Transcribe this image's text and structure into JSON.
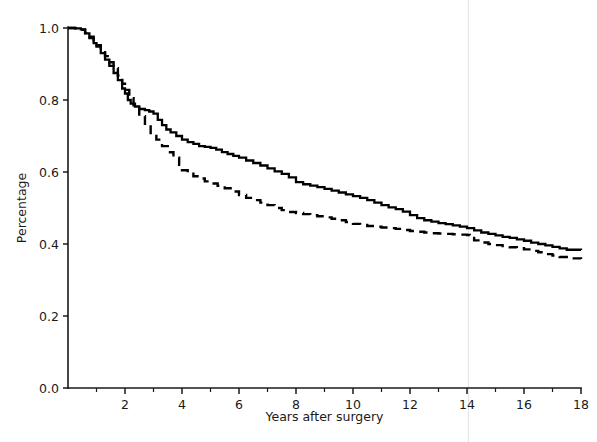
{
  "chart_data": {
    "type": "line",
    "title": "",
    "subtitle": "",
    "xlabel": "Years after surgery",
    "ylabel": "Percentage",
    "xlim": [
      0,
      18
    ],
    "ylim": [
      0.0,
      1.0
    ],
    "xticks": [
      0,
      2,
      4,
      6,
      8,
      10,
      12,
      14,
      16,
      18
    ],
    "xtick_labels": [
      "",
      "2",
      "4",
      "6",
      "8",
      "10",
      "12",
      "14",
      "16",
      "18"
    ],
    "x_minor_ticks": [
      1,
      3,
      5,
      7,
      9,
      11,
      13,
      15,
      17
    ],
    "yticks": [
      0.0,
      0.2,
      0.4,
      0.6,
      0.8,
      1.0
    ],
    "ytick_labels": [
      "0.0",
      "0.2",
      "0.4",
      "0.6",
      "0.8",
      "1.0"
    ],
    "grid": false,
    "legend": "none",
    "annotations": [
      {
        "name": "faint-vertical-artifact-line",
        "x": 14.05,
        "color": "#e2e2e2"
      }
    ],
    "series": [
      {
        "name": "solid-curve",
        "style": "solid",
        "color": "#000000",
        "points": [
          [
            0.0,
            1.0
          ],
          [
            0.25,
            0.999
          ],
          [
            0.45,
            0.996
          ],
          [
            0.6,
            0.985
          ],
          [
            0.75,
            0.972
          ],
          [
            0.9,
            0.958
          ],
          [
            1.0,
            0.948
          ],
          [
            1.15,
            0.93
          ],
          [
            1.3,
            0.912
          ],
          [
            1.45,
            0.895
          ],
          [
            1.6,
            0.875
          ],
          [
            1.75,
            0.855
          ],
          [
            1.9,
            0.832
          ],
          [
            2.0,
            0.818
          ],
          [
            2.1,
            0.8
          ],
          [
            2.2,
            0.79
          ],
          [
            2.35,
            0.782
          ],
          [
            2.5,
            0.775
          ],
          [
            2.7,
            0.772
          ],
          [
            2.85,
            0.768
          ],
          [
            3.0,
            0.762
          ],
          [
            3.15,
            0.745
          ],
          [
            3.3,
            0.73
          ],
          [
            3.45,
            0.718
          ],
          [
            3.6,
            0.71
          ],
          [
            3.8,
            0.7
          ],
          [
            4.0,
            0.69
          ],
          [
            4.2,
            0.683
          ],
          [
            4.4,
            0.678
          ],
          [
            4.6,
            0.672
          ],
          [
            4.8,
            0.67
          ],
          [
            5.0,
            0.667
          ],
          [
            5.2,
            0.662
          ],
          [
            5.4,
            0.655
          ],
          [
            5.6,
            0.65
          ],
          [
            5.8,
            0.645
          ],
          [
            6.0,
            0.64
          ],
          [
            6.25,
            0.632
          ],
          [
            6.5,
            0.625
          ],
          [
            6.75,
            0.618
          ],
          [
            7.0,
            0.61
          ],
          [
            7.25,
            0.602
          ],
          [
            7.5,
            0.595
          ],
          [
            7.75,
            0.585
          ],
          [
            8.0,
            0.572
          ],
          [
            8.25,
            0.566
          ],
          [
            8.5,
            0.562
          ],
          [
            8.75,
            0.558
          ],
          [
            9.0,
            0.553
          ],
          [
            9.25,
            0.548
          ],
          [
            9.5,
            0.543
          ],
          [
            9.75,
            0.538
          ],
          [
            10.0,
            0.533
          ],
          [
            10.25,
            0.528
          ],
          [
            10.5,
            0.522
          ],
          [
            10.75,
            0.515
          ],
          [
            11.0,
            0.508
          ],
          [
            11.25,
            0.502
          ],
          [
            11.5,
            0.497
          ],
          [
            11.75,
            0.49
          ],
          [
            12.0,
            0.48
          ],
          [
            12.25,
            0.472
          ],
          [
            12.5,
            0.466
          ],
          [
            12.75,
            0.462
          ],
          [
            13.0,
            0.458
          ],
          [
            13.25,
            0.455
          ],
          [
            13.5,
            0.452
          ],
          [
            13.75,
            0.448
          ],
          [
            14.0,
            0.444
          ],
          [
            14.25,
            0.438
          ],
          [
            14.5,
            0.432
          ],
          [
            14.75,
            0.428
          ],
          [
            15.0,
            0.424
          ],
          [
            15.25,
            0.42
          ],
          [
            15.5,
            0.417
          ],
          [
            15.75,
            0.413
          ],
          [
            16.0,
            0.409
          ],
          [
            16.25,
            0.404
          ],
          [
            16.5,
            0.4
          ],
          [
            16.75,
            0.396
          ],
          [
            17.0,
            0.392
          ],
          [
            17.25,
            0.388
          ],
          [
            17.5,
            0.384
          ],
          [
            18.0,
            0.383
          ]
        ]
      },
      {
        "name": "dashed-curve",
        "style": "dashed",
        "color": "#000000",
        "points": [
          [
            0.0,
            1.0
          ],
          [
            0.25,
            0.999
          ],
          [
            0.45,
            0.995
          ],
          [
            0.6,
            0.986
          ],
          [
            0.75,
            0.976
          ],
          [
            0.9,
            0.962
          ],
          [
            1.0,
            0.952
          ],
          [
            1.15,
            0.938
          ],
          [
            1.3,
            0.922
          ],
          [
            1.45,
            0.905
          ],
          [
            1.6,
            0.888
          ],
          [
            1.75,
            0.868
          ],
          [
            1.9,
            0.845
          ],
          [
            2.0,
            0.828
          ],
          [
            2.15,
            0.805
          ],
          [
            2.3,
            0.782
          ],
          [
            2.5,
            0.755
          ],
          [
            2.7,
            0.73
          ],
          [
            2.9,
            0.708
          ],
          [
            3.1,
            0.69
          ],
          [
            3.3,
            0.672
          ],
          [
            3.5,
            0.655
          ],
          [
            3.7,
            0.64
          ],
          [
            3.9,
            0.62
          ],
          [
            4.0,
            0.605
          ],
          [
            4.2,
            0.595
          ],
          [
            4.4,
            0.588
          ],
          [
            4.6,
            0.582
          ],
          [
            4.8,
            0.574
          ],
          [
            5.0,
            0.568
          ],
          [
            5.25,
            0.562
          ],
          [
            5.5,
            0.555
          ],
          [
            5.75,
            0.546
          ],
          [
            6.0,
            0.536
          ],
          [
            6.25,
            0.528
          ],
          [
            6.5,
            0.522
          ],
          [
            6.75,
            0.515
          ],
          [
            7.0,
            0.508
          ],
          [
            7.25,
            0.5
          ],
          [
            7.5,
            0.494
          ],
          [
            7.75,
            0.489
          ],
          [
            8.0,
            0.486
          ],
          [
            8.25,
            0.483
          ],
          [
            8.5,
            0.48
          ],
          [
            8.75,
            0.477
          ],
          [
            9.0,
            0.474
          ],
          [
            9.25,
            0.47
          ],
          [
            9.5,
            0.466
          ],
          [
            9.75,
            0.461
          ],
          [
            10.0,
            0.456
          ],
          [
            10.25,
            0.453
          ],
          [
            10.5,
            0.45
          ],
          [
            10.75,
            0.448
          ],
          [
            11.0,
            0.446
          ],
          [
            11.25,
            0.444
          ],
          [
            11.5,
            0.442
          ],
          [
            11.75,
            0.439
          ],
          [
            12.0,
            0.436
          ],
          [
            12.25,
            0.434
          ],
          [
            12.5,
            0.432
          ],
          [
            12.75,
            0.43
          ],
          [
            13.0,
            0.429
          ],
          [
            13.25,
            0.428
          ],
          [
            13.5,
            0.427
          ],
          [
            13.75,
            0.426
          ],
          [
            14.0,
            0.425
          ],
          [
            14.1,
            0.42
          ],
          [
            14.25,
            0.41
          ],
          [
            14.5,
            0.404
          ],
          [
            14.75,
            0.4
          ],
          [
            15.0,
            0.397
          ],
          [
            15.25,
            0.394
          ],
          [
            15.5,
            0.391
          ],
          [
            15.75,
            0.388
          ],
          [
            16.0,
            0.385
          ],
          [
            16.25,
            0.381
          ],
          [
            16.5,
            0.377
          ],
          [
            16.75,
            0.372
          ],
          [
            17.0,
            0.368
          ],
          [
            17.25,
            0.364
          ],
          [
            17.5,
            0.36
          ],
          [
            18.0,
            0.355
          ]
        ]
      }
    ]
  },
  "axes": {
    "x_title": "Years after surgery",
    "y_title": "Percentage"
  }
}
